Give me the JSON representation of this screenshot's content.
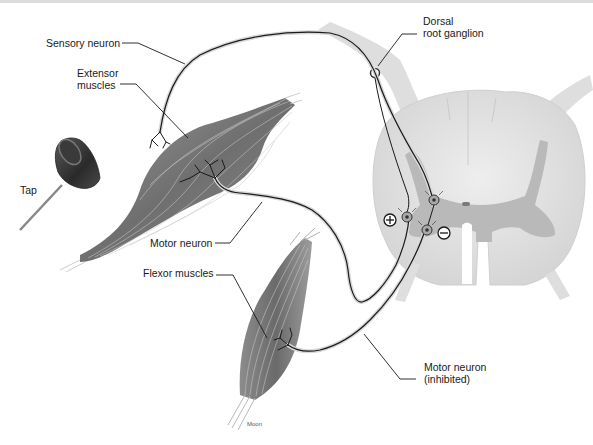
{
  "diagram": {
    "labels": {
      "sensory_neuron": "Sensory neuron",
      "extensor_muscles_line1": "Extensor",
      "extensor_muscles_line2": "muscles",
      "tap": "Tap",
      "motor_neuron": "Motor neuron",
      "flexor_muscles": "Flexor muscles",
      "dorsal_line1": "Dorsal",
      "dorsal_line2": "root ganglion",
      "motor_inhibited_line1": "Motor neuron",
      "motor_inhibited_line2": "(inhibited)"
    },
    "symbols": {
      "excitatory": "+",
      "inhibitory": "−"
    },
    "credit": "Moon",
    "colors": {
      "background": "#ffffff",
      "muscle_dark": "#6e6e6e",
      "muscle_light": "#b8b8b8",
      "spinal_white_matter": "#e0e0e0",
      "spinal_gray_matter": "#b5b5b5",
      "nerve_line": "#1a1a1a",
      "nerve_sheath": "#d8d8d8"
    }
  }
}
